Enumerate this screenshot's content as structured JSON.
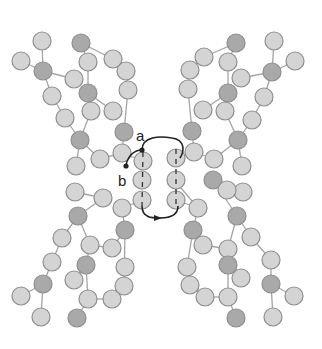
{
  "diagram": {
    "labels": {
      "a": "a",
      "b": "b"
    },
    "colors": {
      "background": "#ffffff",
      "residue_light": "#d4d4d4",
      "residue_dark": "#a9a9a9",
      "residue_stroke": "#8e8e8e",
      "bond": "#a5a5a5",
      "arrow": "#222222",
      "axis_dash": "#333333"
    },
    "residue_radius": 9,
    "residues": [
      {
        "x": 42,
        "y": 41,
        "d": 0
      },
      {
        "x": 21,
        "y": 61,
        "d": 0
      },
      {
        "x": 43,
        "y": 71,
        "d": 1
      },
      {
        "x": 74,
        "y": 79,
        "d": 0
      },
      {
        "x": 52,
        "y": 96,
        "d": 0
      },
      {
        "x": 81,
        "y": 43,
        "d": 1
      },
      {
        "x": 88,
        "y": 62,
        "d": 0
      },
      {
        "x": 88,
        "y": 93,
        "d": 1
      },
      {
        "x": 113,
        "y": 59,
        "d": 0
      },
      {
        "x": 126,
        "y": 71,
        "d": 0
      },
      {
        "x": 128,
        "y": 90,
        "d": 0
      },
      {
        "x": 91,
        "y": 111,
        "d": 0
      },
      {
        "x": 113,
        "y": 111,
        "d": 0
      },
      {
        "x": 65,
        "y": 118,
        "d": 0
      },
      {
        "x": 80,
        "y": 140,
        "d": 1
      },
      {
        "x": 124,
        "y": 132,
        "d": 1
      },
      {
        "x": 122,
        "y": 153,
        "d": 0
      },
      {
        "x": 100,
        "y": 159,
        "d": 0
      },
      {
        "x": 76,
        "y": 166,
        "d": 0
      },
      {
        "x": 236,
        "y": 43,
        "d": 1
      },
      {
        "x": 204,
        "y": 57,
        "d": 0
      },
      {
        "x": 190,
        "y": 70,
        "d": 0
      },
      {
        "x": 228,
        "y": 62,
        "d": 0
      },
      {
        "x": 188,
        "y": 89,
        "d": 0
      },
      {
        "x": 241,
        "y": 78,
        "d": 0
      },
      {
        "x": 228,
        "y": 93,
        "d": 1
      },
      {
        "x": 274,
        "y": 41,
        "d": 0
      },
      {
        "x": 295,
        "y": 61,
        "d": 0
      },
      {
        "x": 272,
        "y": 72,
        "d": 1
      },
      {
        "x": 264,
        "y": 97,
        "d": 0
      },
      {
        "x": 203,
        "y": 110,
        "d": 0
      },
      {
        "x": 225,
        "y": 111,
        "d": 0
      },
      {
        "x": 252,
        "y": 120,
        "d": 0
      },
      {
        "x": 192,
        "y": 131,
        "d": 1
      },
      {
        "x": 238,
        "y": 140,
        "d": 1
      },
      {
        "x": 194,
        "y": 152,
        "d": 0
      },
      {
        "x": 214,
        "y": 159,
        "d": 0
      },
      {
        "x": 242,
        "y": 166,
        "d": 0
      },
      {
        "x": 75,
        "y": 192,
        "d": 0
      },
      {
        "x": 103,
        "y": 198,
        "d": 0
      },
      {
        "x": 78,
        "y": 216,
        "d": 1
      },
      {
        "x": 122,
        "y": 208,
        "d": 0
      },
      {
        "x": 62,
        "y": 238,
        "d": 0
      },
      {
        "x": 90,
        "y": 245,
        "d": 0
      },
      {
        "x": 112,
        "y": 248,
        "d": 0
      },
      {
        "x": 125,
        "y": 230,
        "d": 1
      },
      {
        "x": 52,
        "y": 262,
        "d": 0
      },
      {
        "x": 86,
        "y": 265,
        "d": 1
      },
      {
        "x": 74,
        "y": 280,
        "d": 0
      },
      {
        "x": 125,
        "y": 267,
        "d": 0
      },
      {
        "x": 43,
        "y": 284,
        "d": 1
      },
      {
        "x": 21,
        "y": 296,
        "d": 0
      },
      {
        "x": 88,
        "y": 299,
        "d": 0
      },
      {
        "x": 112,
        "y": 299,
        "d": 0
      },
      {
        "x": 124,
        "y": 286,
        "d": 0
      },
      {
        "x": 41,
        "y": 317,
        "d": 0
      },
      {
        "x": 77,
        "y": 318,
        "d": 1
      },
      {
        "x": 198,
        "y": 208,
        "d": 0
      },
      {
        "x": 213,
        "y": 180,
        "d": 1
      },
      {
        "x": 243,
        "y": 192,
        "d": 0
      },
      {
        "x": 193,
        "y": 230,
        "d": 1
      },
      {
        "x": 227,
        "y": 190,
        "d": 0
      },
      {
        "x": 237,
        "y": 216,
        "d": 1
      },
      {
        "x": 203,
        "y": 245,
        "d": 0
      },
      {
        "x": 251,
        "y": 237,
        "d": 0
      },
      {
        "x": 228,
        "y": 249,
        "d": 0
      },
      {
        "x": 187,
        "y": 267,
        "d": 0
      },
      {
        "x": 228,
        "y": 265,
        "d": 1
      },
      {
        "x": 241,
        "y": 278,
        "d": 0
      },
      {
        "x": 271,
        "y": 260,
        "d": 0
      },
      {
        "x": 190,
        "y": 285,
        "d": 0
      },
      {
        "x": 205,
        "y": 297,
        "d": 0
      },
      {
        "x": 228,
        "y": 297,
        "d": 0
      },
      {
        "x": 271,
        "y": 284,
        "d": 1
      },
      {
        "x": 294,
        "y": 296,
        "d": 0
      },
      {
        "x": 236,
        "y": 318,
        "d": 1
      },
      {
        "x": 273,
        "y": 317,
        "d": 0
      }
    ],
    "helix_left": [
      {
        "x": 143,
        "y": 161
      },
      {
        "x": 142,
        "y": 180
      },
      {
        "x": 142,
        "y": 200
      }
    ],
    "helix_right": [
      {
        "x": 176,
        "y": 158
      },
      {
        "x": 176,
        "y": 180
      },
      {
        "x": 176,
        "y": 200
      }
    ],
    "bonds": [
      [
        42,
        41,
        43,
        71
      ],
      [
        21,
        61,
        43,
        71
      ],
      [
        43,
        71,
        74,
        79
      ],
      [
        43,
        71,
        52,
        96
      ],
      [
        52,
        96,
        65,
        118
      ],
      [
        65,
        118,
        80,
        140
      ],
      [
        80,
        140,
        76,
        166
      ],
      [
        81,
        43,
        113,
        59
      ],
      [
        81,
        43,
        88,
        62
      ],
      [
        88,
        62,
        88,
        93
      ],
      [
        113,
        59,
        126,
        71
      ],
      [
        126,
        71,
        128,
        90
      ],
      [
        128,
        90,
        124,
        132
      ],
      [
        88,
        93,
        113,
        111
      ],
      [
        91,
        111,
        80,
        140
      ],
      [
        80,
        140,
        100,
        159
      ],
      [
        124,
        132,
        122,
        153
      ],
      [
        122,
        153,
        143,
        161
      ],
      [
        100,
        159,
        122,
        153
      ],
      [
        274,
        41,
        272,
        72
      ],
      [
        295,
        61,
        272,
        72
      ],
      [
        272,
        72,
        241,
        78
      ],
      [
        272,
        72,
        264,
        97
      ],
      [
        264,
        97,
        252,
        120
      ],
      [
        252,
        120,
        238,
        140
      ],
      [
        238,
        140,
        242,
        166
      ],
      [
        236,
        43,
        204,
        57
      ],
      [
        236,
        43,
        228,
        62
      ],
      [
        228,
        62,
        228,
        93
      ],
      [
        204,
        57,
        190,
        70
      ],
      [
        190,
        70,
        188,
        89
      ],
      [
        188,
        89,
        192,
        131
      ],
      [
        228,
        93,
        203,
        110
      ],
      [
        225,
        111,
        238,
        140
      ],
      [
        238,
        140,
        214,
        159
      ],
      [
        192,
        131,
        194,
        152
      ],
      [
        194,
        152,
        176,
        158
      ],
      [
        214,
        159,
        194,
        152
      ],
      [
        143,
        200,
        122,
        208
      ],
      [
        122,
        208,
        125,
        230
      ],
      [
        125,
        230,
        112,
        248
      ],
      [
        112,
        248,
        90,
        245
      ],
      [
        125,
        230,
        124,
        286
      ],
      [
        103,
        198,
        78,
        216
      ],
      [
        78,
        216,
        62,
        238
      ],
      [
        62,
        238,
        52,
        262
      ],
      [
        52,
        262,
        43,
        284
      ],
      [
        43,
        284,
        21,
        296
      ],
      [
        43,
        284,
        41,
        317
      ],
      [
        78,
        216,
        90,
        245
      ],
      [
        90,
        245,
        86,
        265
      ],
      [
        86,
        265,
        74,
        280
      ],
      [
        86,
        265,
        88,
        299
      ],
      [
        88,
        299,
        77,
        318
      ],
      [
        88,
        299,
        112,
        299
      ],
      [
        112,
        299,
        124,
        286
      ],
      [
        124,
        286,
        125,
        267
      ],
      [
        75,
        192,
        103,
        198
      ],
      [
        176,
        200,
        198,
        208
      ],
      [
        198,
        208,
        193,
        230
      ],
      [
        193,
        230,
        203,
        245
      ],
      [
        203,
        245,
        228,
        249
      ],
      [
        193,
        230,
        187,
        267
      ],
      [
        213,
        180,
        237,
        216
      ],
      [
        237,
        216,
        251,
        237
      ],
      [
        251,
        237,
        271,
        260
      ],
      [
        271,
        260,
        271,
        284
      ],
      [
        271,
        284,
        294,
        296
      ],
      [
        271,
        284,
        273,
        317
      ],
      [
        237,
        216,
        228,
        249
      ],
      [
        228,
        249,
        228,
        265
      ],
      [
        228,
        265,
        241,
        278
      ],
      [
        228,
        265,
        228,
        297
      ],
      [
        228,
        297,
        236,
        318
      ],
      [
        228,
        297,
        205,
        297
      ],
      [
        205,
        297,
        190,
        285
      ],
      [
        190,
        285,
        187,
        267
      ],
      [
        227,
        190,
        213,
        180
      ],
      [
        198,
        208,
        175,
        181
      ]
    ]
  }
}
